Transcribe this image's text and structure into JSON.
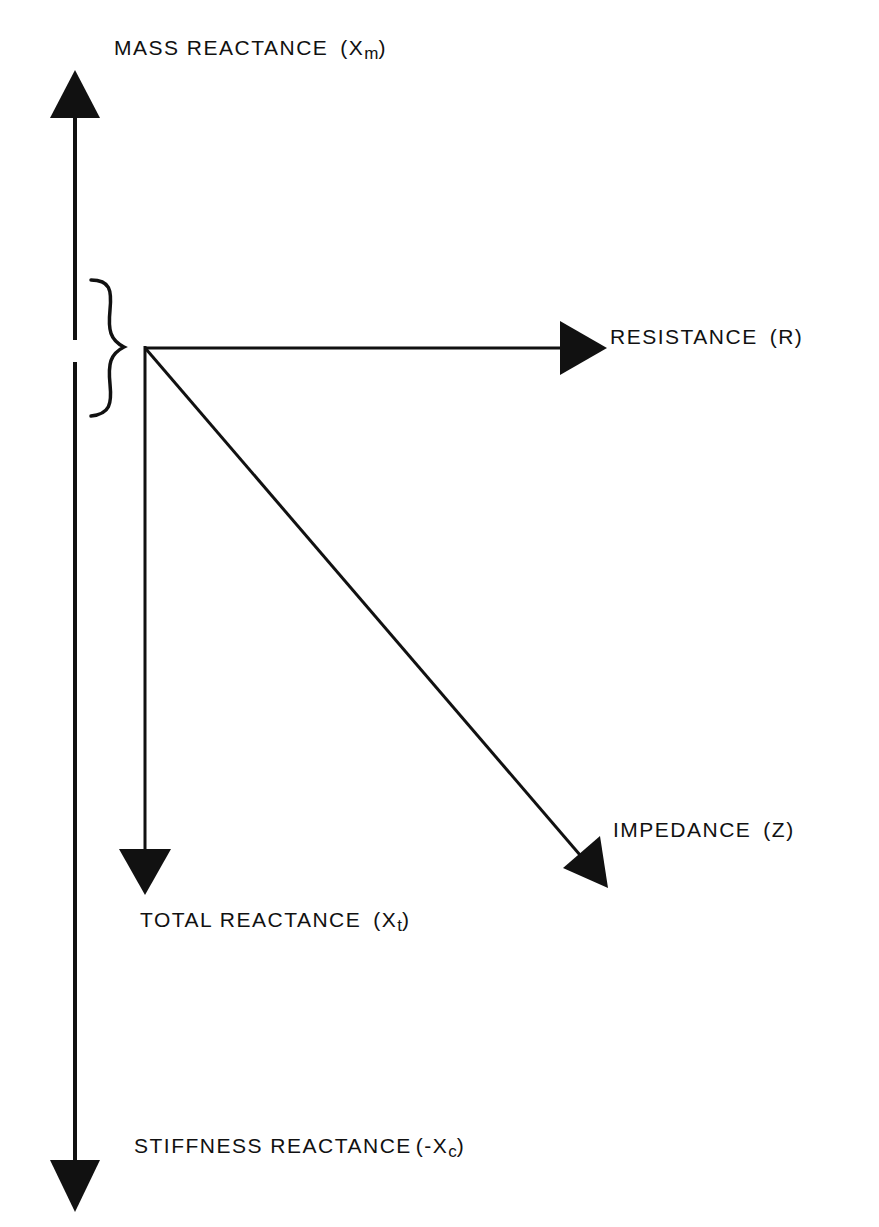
{
  "diagram": {
    "title": "",
    "type": "phasor diagram",
    "colors": {
      "ink": "#111111",
      "background": "#ffffff"
    },
    "labels": {
      "mass_reactance": {
        "text": "MASS REACTANCE",
        "symbol_open": "(X",
        "subscript": "m",
        "symbol_close": ")"
      },
      "resistance": {
        "text": "RESISTANCE",
        "symbol_open": "(R)",
        "subscript": "",
        "symbol_close": ""
      },
      "impedance": {
        "text": "IMPEDANCE",
        "symbol_open": "(Z)",
        "subscript": "",
        "symbol_close": ""
      },
      "total_reactance": {
        "text": "TOTAL REACTANCE",
        "symbol_open": "(X",
        "subscript": "t",
        "symbol_close": ")"
      },
      "stiffness_reactance": {
        "text": "STIFFNESS REACTANCE",
        "symbol_open": "(-X",
        "subscript": "c",
        "symbol_close": ")"
      }
    },
    "vectors": [
      {
        "name": "mass-reactance-axis",
        "direction": "up"
      },
      {
        "name": "stiffness-reactance-axis",
        "direction": "down"
      },
      {
        "name": "resistance",
        "direction": "right"
      },
      {
        "name": "total-reactance",
        "direction": "down"
      },
      {
        "name": "impedance",
        "direction": "down-right"
      }
    ],
    "annotations": [
      {
        "name": "brace",
        "meaning": "total reactance = mass reactance + stiffness reactance"
      }
    ]
  }
}
